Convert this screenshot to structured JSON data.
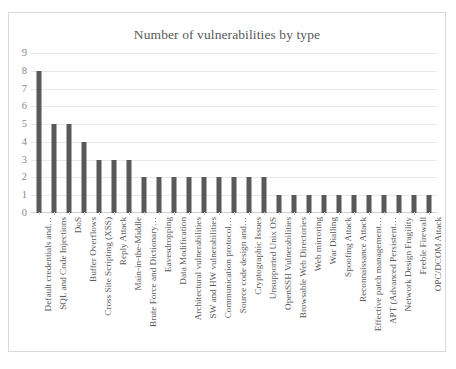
{
  "chart_data": {
    "type": "bar",
    "title": "Number of vulnerabilities by type",
    "xlabel": "",
    "ylabel": "",
    "ylim": [
      0,
      9
    ],
    "yticks": [
      0,
      1,
      2,
      3,
      4,
      5,
      6,
      7,
      8,
      9
    ],
    "grid": true,
    "legend": false,
    "bar_color": "#595959",
    "gridline_color": "#e8e8e8",
    "categories": [
      "Default credentials and…",
      "SQL and Code Injections",
      "DoS",
      "Buffer Overflows",
      "Cross Site Scripting (XSS)",
      "Reply Attack",
      "Main-in-the-Middle",
      "Brute Force and Dictionary…",
      "Eavesdropping",
      "Data Modification",
      "Architectural vulnerabilities",
      "SW and HW vulnerabilities",
      "Communication protocol…",
      "Source code design and…",
      "Cryptographic Issues",
      "Unsupported Unix OS",
      "OpenSSH Vulnerabilities",
      "Browsable Web Directories",
      "Web mirroring",
      "War Dialling",
      "Spoofing Attack",
      "Reconnaissance Attack",
      "Effective patch management…",
      "APT (Advanced Persistent…",
      "Network Design Fragility",
      "Feeble Firewall",
      "OPC/DCOM Attack"
    ],
    "values": [
      8,
      5,
      5,
      4,
      3,
      3,
      3,
      2,
      2,
      2,
      2,
      2,
      2,
      2,
      2,
      2,
      1,
      1,
      1,
      1,
      1,
      1,
      1,
      1,
      1,
      1,
      1
    ]
  }
}
